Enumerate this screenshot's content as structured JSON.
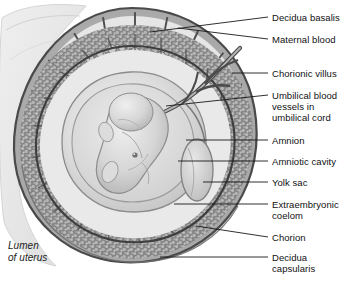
{
  "figure": {
    "background_color": "#ffffff",
    "ink_color": "#111111",
    "leader_color": "#1a1a1a"
  },
  "labels": [
    {
      "id": "decidua-basalis",
      "text": "Decidua basalis",
      "x": 272,
      "y": 12,
      "leader": {
        "x1": 268,
        "y1": 17,
        "x2": 150,
        "y2": 32
      }
    },
    {
      "id": "maternal-blood",
      "text": "Maternal blood",
      "x": 272,
      "y": 34,
      "leader": {
        "x1": 268,
        "y1": 39,
        "x2": 178,
        "y2": 28
      }
    },
    {
      "id": "chorionic-villus",
      "text": "Chorionic villus",
      "x": 272,
      "y": 68,
      "leader": {
        "x1": 268,
        "y1": 73,
        "x2": 232,
        "y2": 73
      }
    },
    {
      "id": "umbilical-vessels",
      "text": "Umbilical blood\nvessels in\numbilical cord",
      "x": 272,
      "y": 90,
      "leader": {
        "x1": 268,
        "y1": 95,
        "x2": 166,
        "y2": 106
      }
    },
    {
      "id": "amnion",
      "text": "Amnion",
      "x": 272,
      "y": 135,
      "leader": {
        "x1": 268,
        "y1": 140,
        "x2": 186,
        "y2": 140
      }
    },
    {
      "id": "amniotic-cavity",
      "text": "Amniotic cavity",
      "x": 272,
      "y": 156,
      "leader": {
        "x1": 268,
        "y1": 161,
        "x2": 178,
        "y2": 161
      }
    },
    {
      "id": "yolk-sac",
      "text": "Yolk sac",
      "x": 272,
      "y": 177,
      "leader": {
        "x1": 268,
        "y1": 182,
        "x2": 203,
        "y2": 182
      }
    },
    {
      "id": "extraembryonic-coelom",
      "text": "Extraembryonic\ncoelom",
      "x": 272,
      "y": 199,
      "leader": {
        "x1": 268,
        "y1": 204,
        "x2": 174,
        "y2": 204
      }
    },
    {
      "id": "chorion",
      "text": "Chorion",
      "x": 272,
      "y": 232,
      "leader": {
        "x1": 268,
        "y1": 237,
        "x2": 196,
        "y2": 226
      }
    },
    {
      "id": "decidua-capsularis",
      "text": "Decidua\ncapsularis",
      "x": 272,
      "y": 252,
      "leader": {
        "x1": 268,
        "y1": 257,
        "x2": 160,
        "y2": 257
      }
    }
  ],
  "annotations": [
    {
      "id": "lumen-of-uterus",
      "text": "Lumen\nof uterus",
      "x": 8,
      "y": 240
    }
  ],
  "chart_data": {
    "type": "diagram",
    "structures": [
      "Decidua basalis",
      "Maternal blood",
      "Chorionic villus",
      "Umbilical blood vessels in umbilical cord",
      "Amnion",
      "Amniotic cavity",
      "Yolk sac",
      "Extraembryonic coelom",
      "Chorion",
      "Decidua capsularis",
      "Lumen of uterus"
    ]
  }
}
